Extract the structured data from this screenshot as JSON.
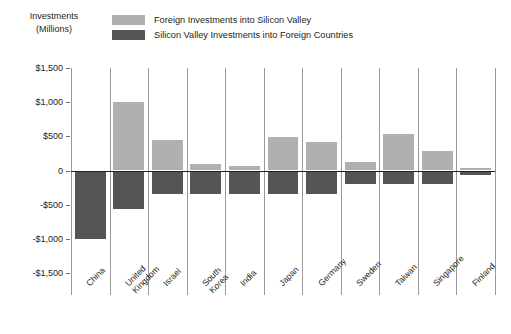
{
  "axis_title": {
    "line1": "Investments",
    "line2": "(Millions)"
  },
  "legend": {
    "position": "top",
    "entries": [
      {
        "label": "Foreign Investments into Silicon Valley",
        "color": "#b0b0b0",
        "name": "foreign-into-sv"
      },
      {
        "label": "Silicon Valley Investments into Foreign Countries",
        "color": "#555555",
        "name": "sv-into-foreign"
      }
    ]
  },
  "chart_data": {
    "type": "bar",
    "title": "",
    "subtitle": "",
    "xlabel": "",
    "ylabel": "Investments (Millions)",
    "ylim": [
      -1500,
      1500
    ],
    "ytick_labels": [
      "$1,500",
      "$1,000",
      "$500",
      "0",
      "-$500",
      "-$1,000",
      "-$1,500"
    ],
    "ytick_values": [
      1500,
      1000,
      500,
      0,
      -500,
      -1000,
      -1500
    ],
    "grid": "vertical-category-separators",
    "zero_line": true,
    "categories": [
      "China",
      "United Kingdom",
      "Israel",
      "South Korea",
      "India",
      "Japan",
      "Germany",
      "Sweden",
      "Taiwan",
      "Singapore",
      "Finland"
    ],
    "series": [
      {
        "name": "Foreign Investments into Silicon Valley",
        "color": "#b0b0b0",
        "values": [
          0,
          1000,
          440,
          100,
          60,
          490,
          420,
          120,
          530,
          290,
          40
        ]
      },
      {
        "name": "Silicon Valley Investments into Foreign Countries",
        "color": "#555555",
        "values": [
          -1000,
          -570,
          -350,
          -350,
          -350,
          -350,
          -350,
          -200,
          -200,
          -200,
          -60
        ]
      }
    ]
  }
}
